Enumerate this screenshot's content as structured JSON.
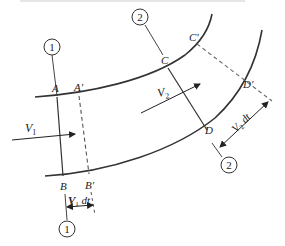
{
  "diagram": {
    "sections": [
      {
        "id": "1",
        "label": "1"
      },
      {
        "id": "2",
        "label": "2"
      }
    ],
    "points": {
      "A": "A",
      "A_prime": "A'",
      "B": "B",
      "B_prime": "B'",
      "C": "C",
      "C_prime": "C'",
      "D": "D",
      "D_prime": "D'"
    },
    "velocities": {
      "v1": "V",
      "v1_sub": "1",
      "v2": "V",
      "v2_sub": "2"
    },
    "displacements": {
      "v1dt_v": "V",
      "v1dt_sub": "1",
      "v1dt_dt": " dt",
      "v2dt_v": "V",
      "v2dt_sub": "2",
      "v2dt_dt": " dt"
    },
    "colors": {
      "line": "#333333",
      "dashed": "#666666"
    }
  }
}
